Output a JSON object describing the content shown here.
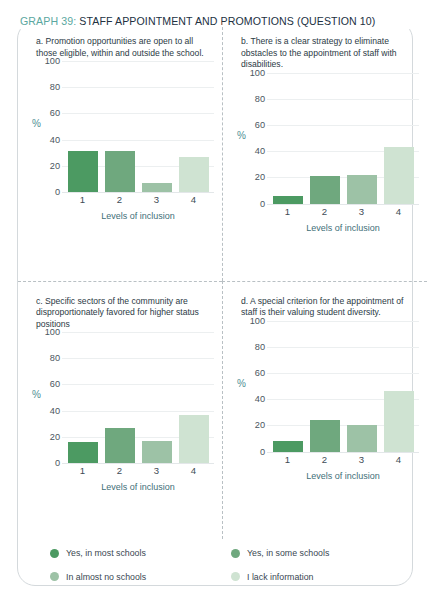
{
  "title": {
    "graph_number": "GRAPH 39:",
    "rest": " STAFF APPOINTMENT AND PROMOTIONS (QUESTION 10)",
    "accent_color": "#5aa7a0",
    "text_color": "#22313f"
  },
  "axis": {
    "y_ticks": [
      "100",
      "80",
      "60",
      "40",
      "20",
      "0"
    ],
    "x_ticks": [
      "1",
      "2",
      "3",
      "4"
    ],
    "x_label": "Levels of inclusion",
    "y_unit": "%"
  },
  "legend": {
    "items": [
      {
        "label": "Yes, in most schools",
        "color": "#4c9a62"
      },
      {
        "label": "Yes, in some schools",
        "color": "#6fa87e"
      },
      {
        "label": "In almost no schools",
        "color": "#9dc2a6"
      },
      {
        "label": "I lack information",
        "color": "#cfe3d2"
      }
    ]
  },
  "chart_data": [
    {
      "type": "bar",
      "id": "a",
      "title": "a. Promotion opportunities are open to all those eligible, within and outside the school.",
      "categories": [
        "1",
        "2",
        "3",
        "4"
      ],
      "values": [
        31,
        31,
        7,
        27
      ],
      "series_labels": [
        "Yes, in most schools",
        "Yes, in some schools",
        "In almost no schools",
        "I lack information"
      ],
      "colors": [
        "#4c9a62",
        "#6fa87e",
        "#9dc2a6",
        "#cfe3d2"
      ],
      "xlabel": "Levels of inclusion",
      "ylabel": "%",
      "ylim": [
        0,
        100
      ],
      "yticks": [
        0,
        20,
        40,
        60,
        80,
        100
      ],
      "grid": true,
      "legend_position": "bottom"
    },
    {
      "type": "bar",
      "id": "b",
      "title": "b. There is a clear strategy to eliminate obstacles to the appointment of staff with disabilities.",
      "categories": [
        "1",
        "2",
        "3",
        "4"
      ],
      "values": [
        6,
        21,
        22,
        43
      ],
      "series_labels": [
        "Yes, in most schools",
        "Yes, in some schools",
        "In almost no schools",
        "I lack information"
      ],
      "colors": [
        "#4c9a62",
        "#6fa87e",
        "#9dc2a6",
        "#cfe3d2"
      ],
      "xlabel": "Levels of inclusion",
      "ylabel": "%",
      "ylim": [
        0,
        100
      ],
      "yticks": [
        0,
        20,
        40,
        60,
        80,
        100
      ],
      "grid": true,
      "legend_position": "bottom"
    },
    {
      "type": "bar",
      "id": "c",
      "title": "c. Specific sectors of the community are disproportionately favored for higher status positions",
      "categories": [
        "1",
        "2",
        "3",
        "4"
      ],
      "values": [
        16,
        27,
        17,
        37
      ],
      "series_labels": [
        "Yes, in most schools",
        "Yes, in some schools",
        "In almost no schools",
        "I lack information"
      ],
      "colors": [
        "#4c9a62",
        "#6fa87e",
        "#9dc2a6",
        "#cfe3d2"
      ],
      "xlabel": "Levels of inclusion",
      "ylabel": "%",
      "ylim": [
        0,
        100
      ],
      "yticks": [
        0,
        20,
        40,
        60,
        80,
        100
      ],
      "grid": true,
      "legend_position": "bottom"
    },
    {
      "type": "bar",
      "id": "d",
      "title": "d. A special criterion for the appointment of staff is their valuing student diversity.",
      "categories": [
        "1",
        "2",
        "3",
        "4"
      ],
      "values": [
        8,
        24,
        20,
        46
      ],
      "series_labels": [
        "Yes, in most schools",
        "Yes, in some schools",
        "In almost no schools",
        "I lack information"
      ],
      "colors": [
        "#4c9a62",
        "#6fa87e",
        "#9dc2a6",
        "#cfe3d2"
      ],
      "xlabel": "Levels of inclusion",
      "ylabel": "%",
      "ylim": [
        0,
        100
      ],
      "yticks": [
        0,
        20,
        40,
        60,
        80,
        100
      ],
      "grid": true,
      "legend_position": "bottom"
    }
  ]
}
